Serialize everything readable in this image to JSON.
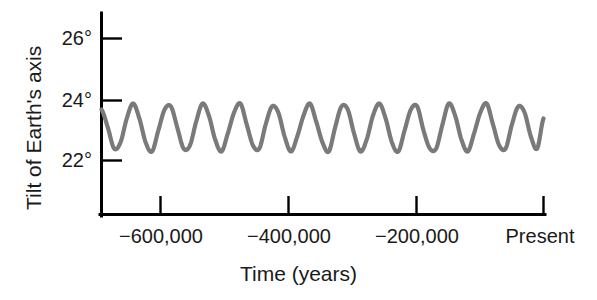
{
  "chart_data": {
    "type": "line",
    "title": "",
    "xlabel": "Time (years)",
    "ylabel": "Tilt of Earth's axis",
    "xlim": [
      -700000,
      0
    ],
    "ylim": [
      21.0,
      26.8
    ],
    "grid": false,
    "legend": null,
    "line_color": "#7a7a7a",
    "line_width": 4.2,
    "axis_color": "#000000",
    "background": "#ffffff",
    "x_tick_values": [
      -600000,
      -400000,
      -200000,
      0
    ],
    "x_tick_labels": [
      "−600,000",
      "−400,000",
      "−200,000",
      "Present"
    ],
    "y_tick_values": [
      26,
      24,
      22
    ],
    "y_tick_labels": [
      "26°",
      "24°",
      "22°"
    ],
    "series": [
      {
        "name": "Obliquity of the ecliptic",
        "description": "Quasi-periodic oscillation of Earth's axial tilt with a period of about 41,000 years",
        "period_years": 41000,
        "mean_value": 23.3,
        "amplitude": 0.8,
        "x": [
          -700000,
          -690000,
          -680000,
          -670000,
          -660000,
          -650000,
          -640000,
          -630000,
          -620000,
          -610000,
          -600000,
          -590000,
          -580000,
          -570000,
          -560000,
          -550000,
          -540000,
          -530000,
          -520000,
          -510000,
          -500000,
          -490000,
          -480000,
          -470000,
          -460000,
          -450000,
          -440000,
          -430000,
          -420000,
          -410000,
          -400000,
          -390000,
          -380000,
          -370000,
          -360000,
          -350000,
          -340000,
          -330000,
          -320000,
          -310000,
          -300000,
          -290000,
          -280000,
          -270000,
          -260000,
          -250000,
          -240000,
          -230000,
          -220000,
          -210000,
          -200000,
          -190000,
          -180000,
          -170000,
          -160000,
          -150000,
          -140000,
          -130000,
          -120000,
          -110000,
          -100000,
          -90000,
          -80000,
          -70000,
          -60000,
          -50000,
          -40000,
          -30000,
          -20000,
          -10000,
          0
        ],
        "values": [
          23.7,
          23.1,
          22.4,
          22.6,
          23.4,
          23.9,
          23.4,
          22.6,
          22.3,
          23.0,
          23.7,
          23.8,
          23.1,
          22.4,
          22.5,
          23.3,
          23.9,
          23.5,
          22.7,
          22.3,
          22.9,
          23.6,
          23.9,
          23.2,
          22.5,
          22.4,
          23.2,
          23.8,
          23.6,
          22.8,
          22.3,
          22.8,
          23.5,
          23.9,
          23.3,
          22.6,
          22.3,
          23.1,
          23.8,
          23.7,
          22.9,
          22.3,
          22.7,
          23.5,
          23.9,
          23.4,
          22.6,
          22.3,
          23.0,
          23.7,
          23.8,
          23.0,
          22.4,
          22.4,
          23.2,
          23.9,
          23.5,
          22.7,
          22.3,
          22.9,
          23.6,
          23.9,
          23.2,
          22.5,
          22.4,
          23.2,
          23.8,
          23.6,
          22.8,
          22.4,
          23.4
        ],
        "peak_value": 23.9,
        "trough_value": 22.3,
        "present_value": 23.4,
        "cycle_count": 17
      }
    ]
  },
  "axes": {
    "y_ticks": [
      {
        "label": "26°"
      },
      {
        "label": "24°"
      },
      {
        "label": "22°"
      }
    ],
    "x_ticks": [
      {
        "label": "−600,000"
      },
      {
        "label": "−400,000"
      },
      {
        "label": "−200,000"
      },
      {
        "label": "Present"
      }
    ],
    "x_title": "Time (years)",
    "y_title": "Tilt of Earth's axis"
  }
}
